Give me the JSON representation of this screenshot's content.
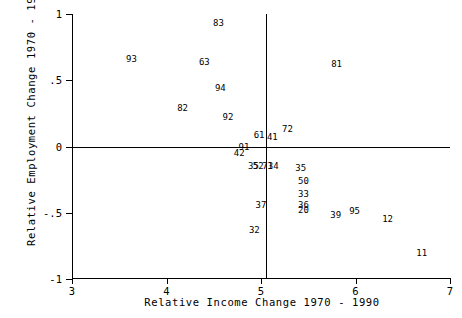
{
  "chart_data": {
    "type": "scatter",
    "title": "",
    "xlabel": "Relative Income Change 1970 - 1990",
    "ylabel": "Relative Employment Change 1970 - 1990",
    "xlim": [
      3,
      7
    ],
    "ylim": [
      -1,
      1
    ],
    "xticks": [
      3,
      4,
      5,
      6,
      7
    ],
    "xticklabels": [
      "3",
      "4",
      "5",
      "6",
      "7"
    ],
    "yticks": [
      1,
      0.5,
      0,
      -0.5,
      -1
    ],
    "yticklabels": [
      "1",
      ".5",
      "0",
      "-.5",
      "-1"
    ],
    "grid": false,
    "legend": null,
    "marker_style": "text-label",
    "reference_lines": [
      {
        "orientation": "horizontal",
        "value": 0
      },
      {
        "orientation": "vertical",
        "value": 5.05
      }
    ],
    "points": [
      {
        "label": "83",
        "x": 4.55,
        "y": 0.93
      },
      {
        "label": "93",
        "x": 3.63,
        "y": 0.66
      },
      {
        "label": "63",
        "x": 4.4,
        "y": 0.64
      },
      {
        "label": "81",
        "x": 5.8,
        "y": 0.62
      },
      {
        "label": "94",
        "x": 4.57,
        "y": 0.44
      },
      {
        "label": "82",
        "x": 4.17,
        "y": 0.29
      },
      {
        "label": "92",
        "x": 4.65,
        "y": 0.22
      },
      {
        "label": "72",
        "x": 5.28,
        "y": 0.13
      },
      {
        "label": "61",
        "x": 4.98,
        "y": 0.09
      },
      {
        "label": "41",
        "x": 5.12,
        "y": 0.07
      },
      {
        "label": "91",
        "x": 4.82,
        "y": 0.0
      },
      {
        "label": "42",
        "x": 4.77,
        "y": -0.05
      },
      {
        "label": "35",
        "x": 4.92,
        "y": -0.15
      },
      {
        "label": "52",
        "x": 4.97,
        "y": -0.15
      },
      {
        "label": "71",
        "x": 5.07,
        "y": -0.15
      },
      {
        "label": "34",
        "x": 5.13,
        "y": -0.15
      },
      {
        "label": "35",
        "x": 5.42,
        "y": -0.16
      },
      {
        "label": "50",
        "x": 5.45,
        "y": -0.26
      },
      {
        "label": "33",
        "x": 5.45,
        "y": -0.36
      },
      {
        "label": "37",
        "x": 5.0,
        "y": -0.44
      },
      {
        "label": "36",
        "x": 5.45,
        "y": -0.44
      },
      {
        "label": "20",
        "x": 5.45,
        "y": -0.48
      },
      {
        "label": "39",
        "x": 5.79,
        "y": -0.52
      },
      {
        "label": "95",
        "x": 5.99,
        "y": -0.49
      },
      {
        "label": "12",
        "x": 6.34,
        "y": -0.55
      },
      {
        "label": "32",
        "x": 4.93,
        "y": -0.63
      },
      {
        "label": "11",
        "x": 6.7,
        "y": -0.8
      }
    ]
  }
}
